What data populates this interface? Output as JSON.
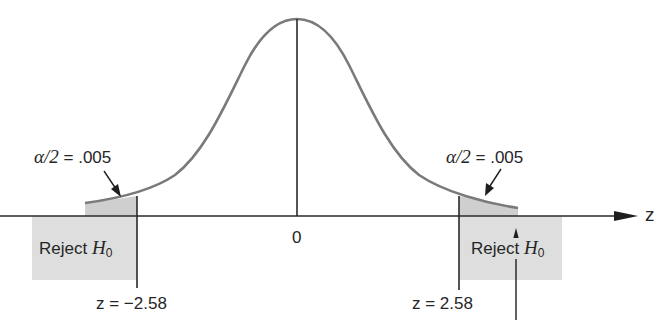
{
  "diagram": {
    "type": "two-tailed normal distribution rejection regions",
    "axis": {
      "label": "z",
      "center_tick": "0"
    },
    "colors": {
      "curve": "#7a7a7a",
      "axis": "#2a2a2a",
      "tail_fill": "#cfcfcf",
      "reject_box": "#dedede"
    },
    "left_tail": {
      "alpha_label_symbol": "α/2",
      "alpha_label_eq": "=",
      "alpha_label_value": ".005",
      "reject_label": "Reject",
      "reject_symbol": "H",
      "reject_subscript": "0",
      "critical_value_label": "z = −2.58"
    },
    "right_tail": {
      "alpha_label_symbol": "α/2",
      "alpha_label_eq": "=",
      "alpha_label_value": ".005",
      "reject_label": "Reject",
      "reject_symbol": "H",
      "reject_subscript": "0",
      "critical_value_label": "z = 2.58"
    }
  }
}
